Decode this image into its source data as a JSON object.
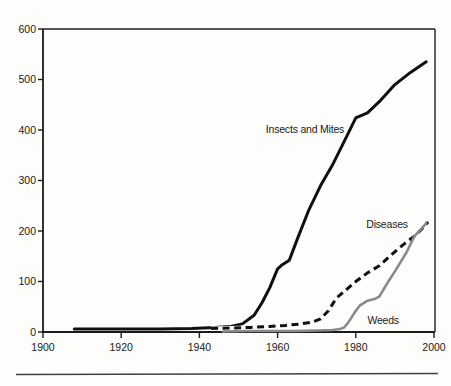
{
  "figure": {
    "background": "#fdfdfb",
    "footer_rule": {
      "present": true,
      "color": "#3f3f3f"
    }
  },
  "chart_data": {
    "type": "line",
    "title": "",
    "xlabel": "",
    "ylabel": "",
    "xlim": [
      1900,
      2000
    ],
    "ylim": [
      0,
      600
    ],
    "x_ticks": [
      1900,
      1920,
      1940,
      1960,
      1980,
      2000
    ],
    "y_ticks": [
      0,
      100,
      200,
      300,
      400,
      500,
      600
    ],
    "grid": false,
    "legend": "inline-labels",
    "axis_color": "#1b1b1b",
    "series": [
      {
        "name": "Insects and Mites",
        "line_style": "solid",
        "color": "#101010",
        "stroke_width": 3,
        "label": {
          "text": "Insects and Mites",
          "at_year": 1967,
          "at_value": 402
        },
        "points": [
          [
            1908,
            6
          ],
          [
            1920,
            6
          ],
          [
            1930,
            6
          ],
          [
            1938,
            7
          ],
          [
            1944,
            9
          ],
          [
            1948,
            11
          ],
          [
            1951,
            16
          ],
          [
            1954,
            33
          ],
          [
            1956,
            58
          ],
          [
            1958,
            88
          ],
          [
            1960,
            125
          ],
          [
            1961,
            132
          ],
          [
            1963,
            142
          ],
          [
            1965,
            183
          ],
          [
            1968,
            242
          ],
          [
            1971,
            290
          ],
          [
            1974,
            330
          ],
          [
            1977,
            377
          ],
          [
            1980,
            424
          ],
          [
            1983,
            434
          ],
          [
            1986,
            456
          ],
          [
            1990,
            490
          ],
          [
            1994,
            514
          ],
          [
            1998,
            535
          ]
        ]
      },
      {
        "name": "Diseases",
        "line_style": "dashed",
        "color": "#101010",
        "stroke_width": 3,
        "label": {
          "text": "Diseases",
          "at_year": 1988,
          "at_value": 214
        },
        "points": [
          [
            1943,
            7
          ],
          [
            1948,
            8
          ],
          [
            1953,
            9
          ],
          [
            1958,
            11
          ],
          [
            1962,
            13
          ],
          [
            1966,
            16
          ],
          [
            1969,
            20
          ],
          [
            1971,
            26
          ],
          [
            1973,
            42
          ],
          [
            1975,
            67
          ],
          [
            1977,
            80
          ],
          [
            1980,
            100
          ],
          [
            1983,
            117
          ],
          [
            1986,
            131
          ],
          [
            1989,
            152
          ],
          [
            1992,
            172
          ],
          [
            1995,
            190
          ],
          [
            1997,
            205
          ],
          [
            1998.5,
            218
          ]
        ]
      },
      {
        "name": "Weeds",
        "line_style": "solid",
        "color": "#8a8a8a",
        "stroke_width": 2.6,
        "label": {
          "text": "Weeds",
          "at_year": 1987,
          "at_value": 24
        },
        "points": [
          [
            1946,
            1
          ],
          [
            1952,
            2
          ],
          [
            1958,
            2
          ],
          [
            1964,
            2
          ],
          [
            1970,
            3
          ],
          [
            1974,
            4
          ],
          [
            1976,
            6
          ],
          [
            1977,
            9
          ],
          [
            1978,
            18
          ],
          [
            1979,
            30
          ],
          [
            1980,
            42
          ],
          [
            1981,
            52
          ],
          [
            1983,
            62
          ],
          [
            1985,
            66
          ],
          [
            1986,
            70
          ],
          [
            1988,
            96
          ],
          [
            1990,
            120
          ],
          [
            1992,
            145
          ],
          [
            1993,
            158
          ],
          [
            1995,
            190
          ],
          [
            1996,
            198
          ],
          [
            1998,
            215
          ]
        ]
      }
    ]
  }
}
